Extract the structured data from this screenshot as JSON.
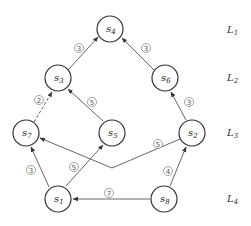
{
  "diagram": {
    "type": "layered directed graph",
    "nodes": [
      {
        "id": "s4",
        "label": "s",
        "sub": "4",
        "x": 110,
        "y": 29
      },
      {
        "id": "s3",
        "label": "s",
        "sub": "3",
        "x": 58,
        "y": 78
      },
      {
        "id": "s6",
        "label": "s",
        "sub": "6",
        "x": 165,
        "y": 78
      },
      {
        "id": "s7",
        "label": "s",
        "sub": "7",
        "x": 26,
        "y": 133
      },
      {
        "id": "s5",
        "label": "s",
        "sub": "5",
        "x": 112,
        "y": 133
      },
      {
        "id": "s2",
        "label": "s",
        "sub": "2",
        "x": 192,
        "y": 133
      },
      {
        "id": "s1",
        "label": "s",
        "sub": "1",
        "x": 58,
        "y": 199
      },
      {
        "id": "s8",
        "label": "s",
        "sub": "8",
        "x": 164,
        "y": 199
      }
    ],
    "edges": [
      {
        "from": "s3",
        "to": "s4",
        "weight": "3"
      },
      {
        "from": "s6",
        "to": "s4",
        "weight": "3"
      },
      {
        "from": "s7",
        "to": "s3",
        "weight": "2",
        "dashed": true
      },
      {
        "from": "s5",
        "to": "s3",
        "weight": "5"
      },
      {
        "from": "s2",
        "to": "s6",
        "weight": "3"
      },
      {
        "from": "s1",
        "to": "s7",
        "weight": "3"
      },
      {
        "from": "s1",
        "to": "s5",
        "weight": "5"
      },
      {
        "from": "s2",
        "to": "s7",
        "weight": "5",
        "via": [
          112,
          168
        ]
      },
      {
        "from": "s8",
        "to": "s2",
        "weight": "4"
      },
      {
        "from": "s8",
        "to": "s1",
        "weight": "7"
      }
    ],
    "weight_labels": {
      "w34": "3",
      "w64": "3",
      "w73": "2",
      "w53": "5",
      "w26": "3",
      "w17": "3",
      "w15": "5",
      "w27": "5",
      "w82": "4",
      "w81": "7"
    },
    "levels": [
      {
        "label": "L",
        "sub": "1",
        "y": 33
      },
      {
        "label": "L",
        "sub": "2",
        "y": 81
      },
      {
        "label": "L",
        "sub": "3",
        "y": 136
      },
      {
        "label": "L",
        "sub": "4",
        "y": 202
      }
    ]
  }
}
